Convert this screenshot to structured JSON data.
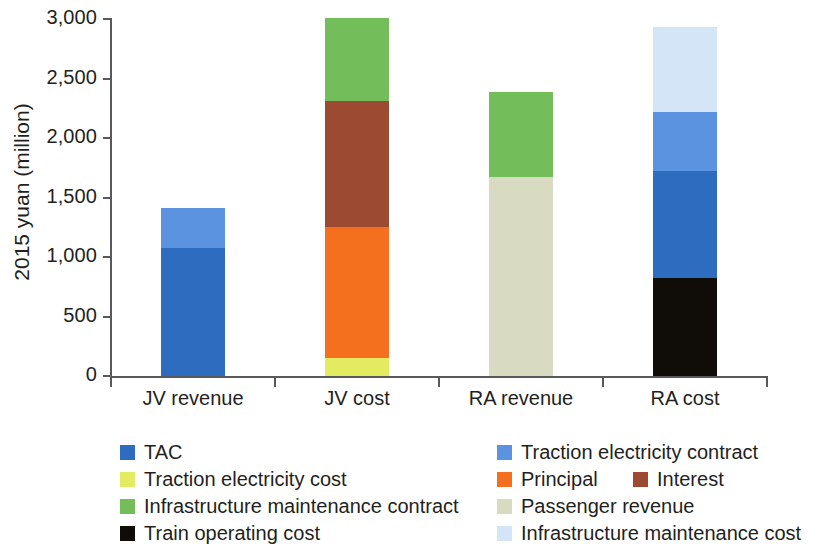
{
  "chart_data": {
    "type": "bar",
    "stacked": true,
    "title": "",
    "xlabel": "",
    "ylabel": "2015 yuan (million)",
    "ylim": [
      0,
      3000
    ],
    "yticks": [
      0,
      500,
      1000,
      1500,
      2000,
      2500,
      3000
    ],
    "ytick_labels": [
      "0",
      "500",
      "1,000",
      "1,500",
      "2,000",
      "2,500",
      "3,000"
    ],
    "grid": false,
    "legend_position": "below",
    "categories": [
      "JV revenue",
      "JV cost",
      "RA revenue",
      "RA cost"
    ],
    "series": [
      {
        "name": "TAC",
        "color": "#2d6cbf",
        "values": [
          1075,
          0,
          0,
          0
        ]
      },
      {
        "name": "Traction electricity contract",
        "color": "#5b93e0",
        "values": [
          335,
          0,
          0,
          0
        ]
      },
      {
        "name": "Traction electricity cost",
        "color": "#e3ec60",
        "values": [
          0,
          150,
          0,
          0
        ]
      },
      {
        "name": "Principal",
        "color": "#f4701f",
        "values": [
          0,
          1100,
          0,
          0
        ]
      },
      {
        "name": "Interest",
        "color": "#9c4a32",
        "values": [
          0,
          1060,
          0,
          0
        ]
      },
      {
        "name": "Infrastructure maintenance contract",
        "color": "#73bd5b",
        "values": [
          0,
          700,
          715,
          0
        ]
      },
      {
        "name": "Passenger revenue",
        "color": "#d8dbc2",
        "values": [
          0,
          0,
          1675,
          0
        ]
      },
      {
        "name": "Train operating cost",
        "color": "#100c08",
        "values": [
          0,
          0,
          0,
          820
        ]
      },
      {
        "name": "Infrastructure maintenance cost",
        "color": "#d4e5f7",
        "values": [
          0,
          0,
          0,
          710
        ]
      }
    ],
    "bars": [
      {
        "category": "JV revenue",
        "total": 1410,
        "segments": [
          {
            "name": "TAC",
            "value": 1075,
            "color": "#2d6cbf"
          },
          {
            "name": "Traction electricity contract",
            "value": 335,
            "color": "#5b93e0"
          }
        ]
      },
      {
        "category": "JV cost",
        "total": 3010,
        "segments": [
          {
            "name": "Traction electricity cost",
            "value": 150,
            "color": "#e3ec60"
          },
          {
            "name": "Principal",
            "value": 1100,
            "color": "#f4701f"
          },
          {
            "name": "Interest",
            "value": 1060,
            "color": "#9c4a32"
          },
          {
            "name": "Infrastructure maintenance contract",
            "value": 700,
            "color": "#73bd5b"
          }
        ]
      },
      {
        "category": "RA revenue",
        "total": 2390,
        "segments": [
          {
            "name": "Passenger revenue",
            "value": 1675,
            "color": "#d8dbc2"
          },
          {
            "name": "Infrastructure maintenance contract",
            "value": 715,
            "color": "#73bd5b"
          }
        ]
      },
      {
        "category": "RA cost",
        "total": 2930,
        "segments": [
          {
            "name": "Train operating cost",
            "value": 820,
            "color": "#100c08"
          },
          {
            "name": "TAC",
            "value": 900,
            "color": "#2d6cbf"
          },
          {
            "name": "Traction electricity contract",
            "value": 500,
            "color": "#5b93e0"
          },
          {
            "name": "Infrastructure maintenance cost",
            "value": 710,
            "color": "#d4e5f7"
          }
        ]
      }
    ]
  },
  "legend": {
    "left_column": [
      {
        "label": "TAC",
        "color": "#2d6cbf"
      },
      {
        "label": "Traction electricity cost",
        "color": "#e3ec60"
      },
      {
        "label": "Infrastructure maintenance contract",
        "color": "#73bd5b"
      },
      {
        "label": "Train operating cost",
        "color": "#100c08"
      }
    ],
    "right_column": [
      {
        "label": "Traction electricity contract",
        "color": "#5b93e0"
      },
      {
        "label": "Principal",
        "color": "#f4701f"
      },
      {
        "label": "Passenger revenue",
        "color": "#d8dbc2"
      },
      {
        "label": "Infrastructure maintenance cost",
        "color": "#d4e5f7"
      }
    ],
    "inline_extra": [
      {
        "label": "Interest",
        "color": "#9c4a32"
      }
    ]
  },
  "axis_colors": {
    "axis_line": "#58595b",
    "text": "#231f20"
  }
}
